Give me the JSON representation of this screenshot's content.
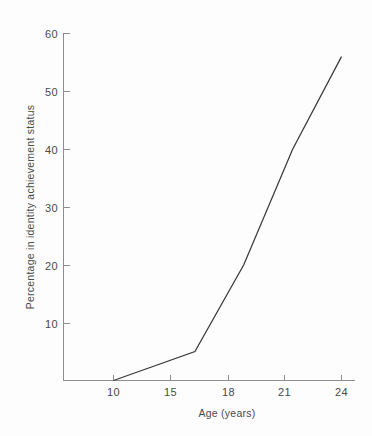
{
  "chart_data": {
    "type": "line",
    "title": "",
    "xlabel": "Age (years)",
    "ylabel": "Percentage in identity achievement status",
    "x": [
      10,
      15,
      18,
      21,
      24
    ],
    "values": [
      0,
      5,
      20,
      40,
      56
    ],
    "categories": [
      "10",
      "15",
      "18",
      "21",
      "24"
    ],
    "xtick_labels": [
      "10",
      "15",
      "18",
      "21",
      "24"
    ],
    "ytick_labels": [
      "10",
      "20",
      "30",
      "40",
      "50",
      "60"
    ],
    "ytick_values": [
      10,
      20,
      30,
      40,
      50,
      60
    ],
    "ylim": [
      0,
      60
    ],
    "xlim": [
      10,
      24
    ],
    "grid": false,
    "legend": "none",
    "series": [
      {
        "name": "Identity achievement",
        "values": [
          0,
          5,
          20,
          40,
          56
        ],
        "color": "#3a3a3a"
      }
    ],
    "line_color": "#3a3a3a",
    "axis_color": "#8e8e8e",
    "background_color": "#fdfdfd",
    "text_color": "#4a4a4a"
  },
  "axes": {
    "y_title": "Percentage in identity achievement status",
    "x_title": "Age (years)",
    "y_ticks": [
      {
        "label": "60",
        "value": 60
      },
      {
        "label": "50",
        "value": 50
      },
      {
        "label": "40",
        "value": 40
      },
      {
        "label": "30",
        "value": 30
      },
      {
        "label": "20",
        "value": 20
      },
      {
        "label": "10",
        "value": 10
      }
    ],
    "x_ticks": [
      {
        "label": "10",
        "value": 10
      },
      {
        "label": "15",
        "value": 15
      },
      {
        "label": "18",
        "value": 18
      },
      {
        "label": "21",
        "value": 21
      },
      {
        "label": "24",
        "value": 24
      }
    ]
  }
}
